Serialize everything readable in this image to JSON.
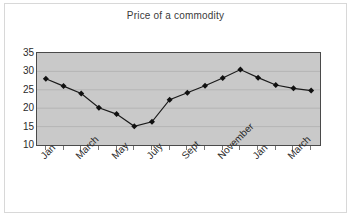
{
  "chart_data": {
    "type": "line",
    "title": "Price of a commodity",
    "xlabel": "",
    "ylabel": "",
    "ylim": [
      10,
      35
    ],
    "yticks": [
      10,
      15,
      20,
      25,
      30,
      35
    ],
    "grid": true,
    "legend": "none",
    "marker": "diamond",
    "categories": [
      "Jan",
      "Feb",
      "March",
      "April",
      "May",
      "June",
      "July",
      "Aug",
      "Sept",
      "Oct",
      "November",
      "Dec",
      "Jan",
      "Feb",
      "March",
      "April"
    ],
    "visible_tick_labels": [
      "Jan",
      "March",
      "May",
      "July",
      "Sept",
      "November",
      "Jan",
      "March"
    ],
    "values": [
      28.0,
      26.0,
      24.0,
      20.1,
      18.4,
      15.1,
      16.3,
      22.3,
      24.2,
      26.1,
      28.2,
      30.5,
      28.3,
      26.3,
      25.4,
      24.8
    ],
    "series": [
      {
        "name": "Price",
        "values": [
          28.0,
          26.0,
          24.0,
          20.1,
          18.4,
          15.1,
          16.3,
          22.3,
          24.2,
          26.1,
          28.2,
          30.5,
          28.3,
          26.3,
          25.4,
          24.8
        ]
      }
    ],
    "colors": {
      "plot_background": "#c9c9c9",
      "figure_background": "#ffffff",
      "line": "#1a1a1a",
      "marker": "#111111",
      "gridline": "#b0b0b0",
      "axis": "#4a4a4a",
      "text": "#2b2b2b"
    }
  }
}
